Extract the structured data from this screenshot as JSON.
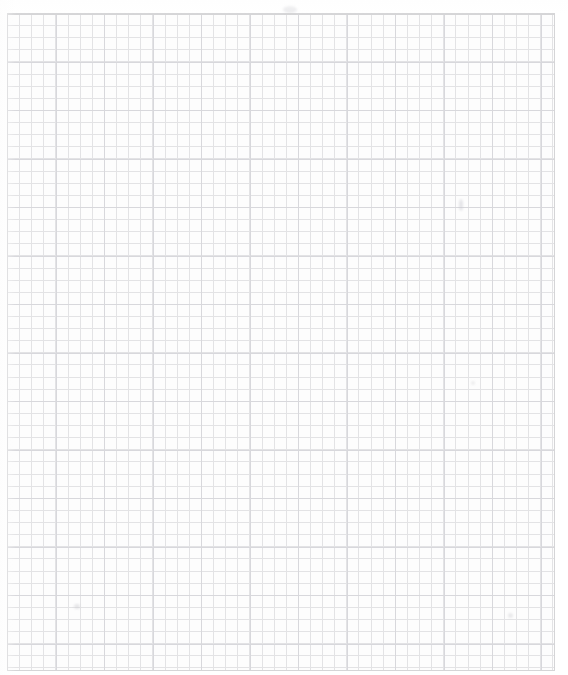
{
  "document": {
    "kind": "grid-paper-scan",
    "title": "Blank squared graph paper sheet",
    "description": "A scanned blank sheet of quadrille / squared graph paper with a light grey printed grid and a ruled border frame. No handwriting, text, numbers or drawings are present on the page.",
    "visible_text": "",
    "orientation": "portrait"
  },
  "canvas": {
    "width": 568,
    "height": 675,
    "background_color": "#ffffff",
    "paper_color": "#fdfdfd"
  },
  "frame": {
    "left": 7,
    "top": 13,
    "width": 548,
    "height": 658,
    "border_color": "#d5d5d7",
    "border_width": 1
  },
  "grid": {
    "cell_size_px": 12.12,
    "columns": 45,
    "rows": 54,
    "minor_line_color": "#e3e3e5",
    "minor_line_width": 1,
    "major_line_color": "#d8d8dc",
    "major_line_width": 1,
    "major_every_cells": 4,
    "major_block_size_px": 48.5
  },
  "marks": [
    {
      "name": "smudge-top-center",
      "x": 283,
      "y": 6,
      "w": 14,
      "h": 7,
      "color": "rgba(205,205,210,0.40)"
    },
    {
      "name": "smudge-right-upper",
      "x": 459,
      "y": 199,
      "w": 4,
      "h": 12,
      "color": "rgba(200,200,206,0.45)"
    },
    {
      "name": "smudge-lower-left",
      "x": 74,
      "y": 604,
      "w": 6,
      "h": 5,
      "color": "rgba(203,203,208,0.45)"
    },
    {
      "name": "smudge-lower-right",
      "x": 508,
      "y": 613,
      "w": 5,
      "h": 5,
      "color": "rgba(206,206,211,0.40)"
    },
    {
      "name": "smudge-mid-right",
      "x": 471,
      "y": 381,
      "w": 4,
      "h": 4,
      "color": "rgba(208,208,212,0.35)"
    }
  ],
  "chart_data": {
    "type": "table",
    "xlabel": "",
    "ylabel": "",
    "columns": 45,
    "rows": 54,
    "categories": [],
    "values": [],
    "grid": true,
    "legend": "none",
    "note": "Empty grid — no plotted data, labels, tick values or annotations appear on the sheet."
  }
}
